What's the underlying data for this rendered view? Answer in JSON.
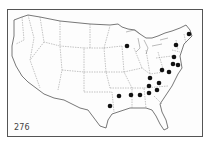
{
  "map": {
    "title": "United States distribution map",
    "label": "276",
    "marker_color": "#111111",
    "line_color": "#666666",
    "points": [
      {
        "region": "Maine",
        "x": 189,
        "y": 34
      },
      {
        "region": "Wisconsin",
        "x": 127,
        "y": 46
      },
      {
        "region": "New York",
        "x": 176,
        "y": 45
      },
      {
        "region": "Pennsylvania",
        "x": 174,
        "y": 57
      },
      {
        "region": "New Jersey",
        "x": 173,
        "y": 64
      },
      {
        "region": "Delaware",
        "x": 178,
        "y": 65
      },
      {
        "region": "West Virginia",
        "x": 162,
        "y": 70
      },
      {
        "region": "Virginia",
        "x": 169,
        "y": 72
      },
      {
        "region": "Kentucky",
        "x": 150,
        "y": 78
      },
      {
        "region": "Virginia-south",
        "x": 159,
        "y": 83
      },
      {
        "region": "Tennessee",
        "x": 149,
        "y": 86
      },
      {
        "region": "North Carolina",
        "x": 157,
        "y": 90
      },
      {
        "region": "Georgia",
        "x": 149,
        "y": 93
      },
      {
        "region": "Alabama",
        "x": 140,
        "y": 95
      },
      {
        "region": "Mississippi",
        "x": 131,
        "y": 95
      },
      {
        "region": "Arkansas",
        "x": 119,
        "y": 96
      },
      {
        "region": "Louisiana",
        "x": 110,
        "y": 106
      }
    ]
  }
}
